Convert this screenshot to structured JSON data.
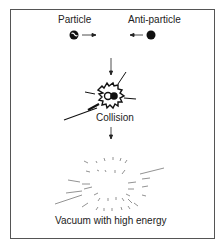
{
  "diagram": {
    "labels": {
      "particle": "Particle",
      "anti_particle": "Anti-particle",
      "collision": "Collision",
      "vacuum": "Vacuum with high energy"
    },
    "colors": {
      "ink": "#111111",
      "frame": "#555555"
    }
  }
}
